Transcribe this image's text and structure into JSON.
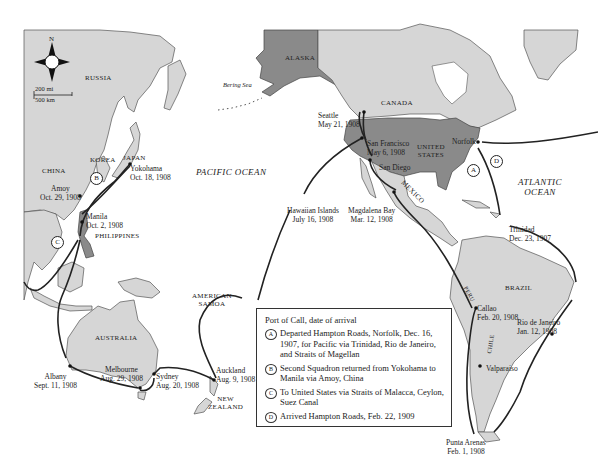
{
  "map": {
    "compass": {
      "north_label": "N"
    },
    "scale": {
      "miles_label": "200 mi",
      "km_label": "500 km"
    },
    "regions": {
      "russia": "RUSSIA",
      "china": "CHINA",
      "korea": "KOREA",
      "japan": "JAPAN",
      "philippines": "PHILIPPINES",
      "australia": "AUSTRALIA",
      "new_zealand": "NEW\nZEALAND",
      "american_samoa": "AMERICAN\nSAMOA",
      "alaska": "ALASKA",
      "canada": "CANADA",
      "united_states": "UNITED\nSTATES",
      "mexico": "MEXICO",
      "brazil": "BRAZIL",
      "peru": "PERU",
      "chile": "CHILE"
    },
    "water": {
      "pacific": "PACIFIC OCEAN",
      "atlantic": "ATLANTIC\nOCEAN",
      "bering": "Bering Sea"
    },
    "ports": [
      {
        "id": "norfolk",
        "name": "Norfolk",
        "date": ""
      },
      {
        "id": "trinidad",
        "name": "Trinidad",
        "date": "Dec. 23, 1907"
      },
      {
        "id": "rio",
        "name": "Rio de Janeiro",
        "date": "Jan. 12, 1908"
      },
      {
        "id": "punta-arenas",
        "name": "Punta Arenas",
        "date": "Feb. 1, 1908"
      },
      {
        "id": "valparaiso",
        "name": "Valparaiso",
        "date": ""
      },
      {
        "id": "callao",
        "name": "Callao",
        "date": "Feb. 20, 1908"
      },
      {
        "id": "magdalena",
        "name": "Magdalena Bay",
        "date": "Mar. 12, 1908"
      },
      {
        "id": "san-diego",
        "name": "San Diego",
        "date": ""
      },
      {
        "id": "san-francisco",
        "name": "San Francisco",
        "date": "May 6, 1908"
      },
      {
        "id": "seattle",
        "name": "Seattle",
        "date": "May 21, 1908"
      },
      {
        "id": "hawaii",
        "name": "Hawaiian Islands",
        "date": "July 16, 1908"
      },
      {
        "id": "auckland",
        "name": "Auckland",
        "date": "Aug. 9, 1908"
      },
      {
        "id": "sydney",
        "name": "Sydney",
        "date": "Aug. 20, 1908"
      },
      {
        "id": "melbourne",
        "name": "Melbourne",
        "date": "Aug. 29, 1908"
      },
      {
        "id": "albany",
        "name": "Albany",
        "date": "Sept. 11, 1908"
      },
      {
        "id": "manila",
        "name": "Manila",
        "date": "Oct. 2, 1908"
      },
      {
        "id": "yokohama",
        "name": "Yokohama",
        "date": "Oct. 18, 1908"
      },
      {
        "id": "amoy",
        "name": "Amoy",
        "date": "Oct. 29, 1908"
      }
    ],
    "route_markers": {
      "a": "A",
      "b": "B",
      "c": "C",
      "d": "D"
    }
  },
  "legend": {
    "title": "Port of Call, date of arrival",
    "items": [
      {
        "key": "A",
        "text": "Departed Hampton Roads, Norfolk, Dec. 16, 1907, for Pacific via Trinidad, Rio de Janeiro, and Straits of Magellan"
      },
      {
        "key": "B",
        "text": "Second Squadron returned from Yokohama to Manila via Amoy, China"
      },
      {
        "key": "C",
        "text": "To United States via Straits of Malacca, Ceylon, Suez Canal"
      },
      {
        "key": "D",
        "text": "Arrived Hampton Roads, Feb. 22, 1909"
      }
    ]
  }
}
